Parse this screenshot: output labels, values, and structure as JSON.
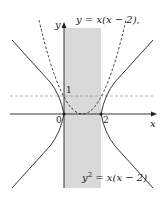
{
  "diagram": {
    "labels": {
      "parabola": "y = x(x − 2),",
      "hyperbola_lhs": "y",
      "hyperbola_exp": "2",
      "hyperbola_rhs": " = x(x − 2)",
      "y_axis": "y",
      "x_axis": "x",
      "origin": "0",
      "two": "2",
      "one": "1"
    },
    "colors": {
      "shade": "#d9d9d9",
      "curve": "#222222",
      "dashed_line": "#999999"
    },
    "curves": [
      {
        "name": "parabola",
        "equation": "y = x(x-2)",
        "style": "dashed"
      },
      {
        "name": "hyperbola",
        "equation": "y^2 = x(x-2)",
        "style": "solid"
      },
      {
        "name": "horizontal-line",
        "equation": "y = 1",
        "style": "dashed"
      }
    ],
    "shaded_region": "0 <= x <= 2"
  }
}
